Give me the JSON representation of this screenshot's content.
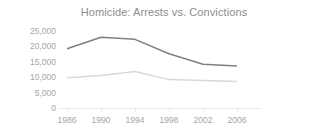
{
  "chart_data": {
    "type": "line",
    "title": "Homicide: Arrests vs. Convictions",
    "xlabel": "",
    "ylabel": "",
    "categories": [
      "1986",
      "1990",
      "1994",
      "1998",
      "2002",
      "2006"
    ],
    "x": [
      1986,
      1990,
      1994,
      1998,
      2002,
      2006
    ],
    "series": [
      {
        "name": "Arrests",
        "color": "#808080",
        "values": [
          19000,
          22700,
          22000,
          17400,
          14000,
          13500
        ]
      },
      {
        "name": "Convictions",
        "color": "#d9d9d9",
        "values": [
          9700,
          10400,
          11700,
          9100,
          8800,
          8500
        ]
      }
    ],
    "ylim": [
      0,
      25000
    ],
    "y_ticks": [
      25000,
      20000,
      15000,
      10000,
      5000,
      0
    ],
    "y_tick_labels": [
      "25,000",
      "20,000",
      "15,000",
      "10,000",
      "5,000",
      "0"
    ],
    "x_tick_labels": [
      "1986",
      "1990",
      "1994",
      "1998",
      "2002",
      "2006"
    ],
    "grid": false,
    "legend": "none",
    "title_color": "#8c8c8c",
    "tick_label_color": "#a6a6a6",
    "axis_color": "#eaeaea",
    "background": "#ffffff"
  }
}
